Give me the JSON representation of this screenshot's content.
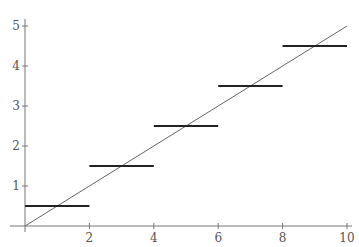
{
  "chart_data": {
    "type": "line",
    "title": "",
    "xlabel": "",
    "ylabel": "",
    "xlim": [
      0,
      10
    ],
    "ylim": [
      0,
      5
    ],
    "grid": false,
    "legend": null,
    "x_ticks": [
      2,
      4,
      6,
      8,
      10
    ],
    "y_ticks": [
      1,
      2,
      3,
      4,
      5
    ],
    "x_tick_labels": [
      "2",
      "4",
      "6",
      "8",
      "10"
    ],
    "y_tick_labels": [
      "1",
      "2",
      "3",
      "4",
      "5"
    ],
    "series": [
      {
        "name": "line y = x/2",
        "kind": "line",
        "x": [
          0,
          10
        ],
        "y": [
          0,
          5
        ],
        "color": "#666666"
      },
      {
        "name": "step approximation",
        "kind": "horizontal-segments",
        "segments": [
          {
            "x0": 0,
            "x1": 2,
            "y": 0.5
          },
          {
            "x0": 2,
            "x1": 4,
            "y": 1.5
          },
          {
            "x0": 4,
            "x1": 6,
            "y": 2.5
          },
          {
            "x0": 6,
            "x1": 8,
            "y": 3.5
          },
          {
            "x0": 8,
            "x1": 10,
            "y": 4.5
          }
        ],
        "color": "#222222"
      }
    ]
  }
}
